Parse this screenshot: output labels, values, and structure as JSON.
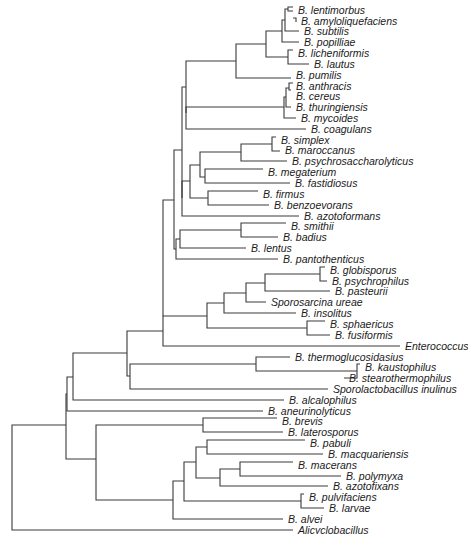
{
  "figure": {
    "type": "phylogenetic-tree",
    "line_color": "#3a3a3a",
    "text_color": "#1a1a1a"
  },
  "leaves": [
    {
      "label": "B. lentimorbus",
      "x": 295,
      "y": 10
    },
    {
      "label": "B. amyloliquefaciens",
      "x": 298,
      "y": 21
    },
    {
      "label": "B. subtilis",
      "x": 301,
      "y": 31
    },
    {
      "label": "B. popilliae",
      "x": 301,
      "y": 42
    },
    {
      "label": "B. licheniformis",
      "x": 295,
      "y": 53
    },
    {
      "label": "B. lautus",
      "x": 311,
      "y": 64
    },
    {
      "label": "B. pumilis",
      "x": 293,
      "y": 75
    },
    {
      "label": "B. anthracis",
      "x": 293,
      "y": 86
    },
    {
      "label": "B. cereus",
      "x": 293,
      "y": 96
    },
    {
      "label": "B. thuringiensis",
      "x": 293,
      "y": 107
    },
    {
      "label": "B. mycoides",
      "x": 298,
      "y": 118
    },
    {
      "label": "B. coagulans",
      "x": 308,
      "y": 129
    },
    {
      "label": "B. simplex",
      "x": 278,
      "y": 140
    },
    {
      "label": "B. maroccanus",
      "x": 282,
      "y": 150
    },
    {
      "label": "B. psychrosaccharolyticus",
      "x": 289,
      "y": 161
    },
    {
      "label": "B. megaterium",
      "x": 265,
      "y": 172
    },
    {
      "label": "B. fastidiosus",
      "x": 292,
      "y": 183
    },
    {
      "label": "B. firmus",
      "x": 260,
      "y": 194
    },
    {
      "label": "B. benzoevorans",
      "x": 271,
      "y": 205
    },
    {
      "label": "B. azotoformans",
      "x": 301,
      "y": 216
    },
    {
      "label": "B. smithii",
      "x": 288,
      "y": 226
    },
    {
      "label": "B. badius",
      "x": 280,
      "y": 237
    },
    {
      "label": "B. lentus",
      "x": 248,
      "y": 248
    },
    {
      "label": "B. pantothenticus",
      "x": 280,
      "y": 259
    },
    {
      "label": "B. globisporus",
      "x": 327,
      "y": 270
    },
    {
      "label": "B. psychrophilus",
      "x": 329,
      "y": 281
    },
    {
      "label": "B. pasteurii",
      "x": 332,
      "y": 291
    },
    {
      "label": "Sporosarcina ureae",
      "x": 268,
      "y": 302
    },
    {
      "label": "B. insolitus",
      "x": 298,
      "y": 313
    },
    {
      "label": "B. sphaericus",
      "x": 327,
      "y": 324
    },
    {
      "label": "B. fusiformis",
      "x": 332,
      "y": 335
    },
    {
      "label": "Enterococcus",
      "x": 402,
      "y": 346
    },
    {
      "label": "B. thermoglucosidasius",
      "x": 292,
      "y": 357
    },
    {
      "label": "B. kaustophilus",
      "x": 362,
      "y": 367
    },
    {
      "label": "B. stearothermophilus",
      "x": 346,
      "y": 378
    },
    {
      "label": "Sporolactobacillus inulinus",
      "x": 330,
      "y": 389
    },
    {
      "label": "B. alcalophilus",
      "x": 286,
      "y": 400
    },
    {
      "label": "B. aneurinolyticus",
      "x": 265,
      "y": 411
    },
    {
      "label": "B. brevis",
      "x": 279,
      "y": 421
    },
    {
      "label": "B. laterosporus",
      "x": 285,
      "y": 432
    },
    {
      "label": "B. pabuli",
      "x": 307,
      "y": 443
    },
    {
      "label": "B. macquariensis",
      "x": 325,
      "y": 454
    },
    {
      "label": "B. macerans",
      "x": 295,
      "y": 465
    },
    {
      "label": "B. polymyxa",
      "x": 343,
      "y": 476
    },
    {
      "label": "B. azotofixans",
      "x": 330,
      "y": 486
    },
    {
      "label": "B. pulvifaciens",
      "x": 306,
      "y": 497
    },
    {
      "label": "B. larvae",
      "x": 326,
      "y": 508
    },
    {
      "label": "B. alvei",
      "x": 285,
      "y": 519
    },
    {
      "label": "Alicyclobacillus",
      "x": 295,
      "y": 530
    }
  ],
  "branches": [
    "M293 7H288V11H293",
    "M288 9H285V31H299",
    "M293 18H296V22H296",
    "M285 20H282V42H299",
    "M293 50H288V64H309",
    "M282 31H266V57H288",
    "M266 44H236V78H291",
    "M293 83H289V90H291",
    "M289 88H286V107H291",
    "M286 97H284V118H296",
    "M284 107H186V129H306",
    "M236 61H186V113",
    "M276 137H272V151H280",
    "M272 144H241V161H287",
    "M263 169H205V183H290",
    "M241 152H200V177H205",
    "M258 191H208V205H269",
    "M200 165H190V198H208",
    "M190 181H182V216H299",
    "M186 87H182V198",
    "M286 223H241V237H278",
    "M241 230H180V248H246",
    "M180 239H176V259H278",
    "M182 150H174V249H176",
    "M325 267H320V281H327",
    "M320 274H265V291H330",
    "M265 283H246V302H266",
    "M246 293H224V313H296",
    "M325 321H307V335H330",
    "M224 303H207V328H307",
    "M207 316H163V346H400",
    "M174 200H163V316",
    "M360 364H357V378H344",
    "M357 371H256V357H290",
    "M256 364H130V389H328",
    "M163 331H127V376H130",
    "M127 353H73V400H284",
    "M73 377H67V411H263",
    "M277 418H203V432H283",
    "M305 440H207V454H323",
    "M293 462H240V476H341",
    "M240 469H220V486H328",
    "M207 447H196V478H220",
    "M304 494H301V508H324",
    "M196 462H184V501H301",
    "M184 481H173V519H283",
    "M203 425H96V500H173",
    "M67 394H66V459H96",
    "M66 425H12V530H293"
  ]
}
